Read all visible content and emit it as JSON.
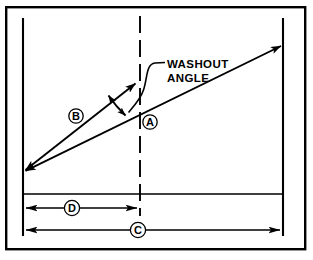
{
  "figure": {
    "kind": "technical-line-diagram",
    "background_color": "#ffffff",
    "ink_color": "#000000",
    "frame": {
      "label": "outer-border",
      "x": 5,
      "y": 6,
      "width": 301,
      "height": 244,
      "stroke_width": 2.4
    }
  },
  "annotations": {
    "callout": {
      "line1": "WASHOUT",
      "line2": "ANGLE",
      "x": 167,
      "y1": 64,
      "y2": 78
    },
    "bubbles": [
      {
        "id": "bubble-a",
        "label": "A",
        "cx": 150,
        "cy": 122,
        "r": 7.2
      },
      {
        "id": "bubble-b",
        "label": "B",
        "cx": 76,
        "cy": 116,
        "r": 7.2
      },
      {
        "id": "bubble-c",
        "label": "C",
        "cx": 138,
        "cy": 230,
        "r": 7.2
      },
      {
        "id": "bubble-d",
        "label": "D",
        "cx": 72,
        "cy": 208,
        "r": 7.2
      }
    ]
  },
  "geometry": {
    "reference_lines": [
      {
        "id": "left-vertical",
        "x1": 23,
        "y1": 18,
        "x2": 23,
        "y2": 236
      },
      {
        "id": "right-vertical",
        "x1": 283,
        "y1": 18,
        "x2": 283,
        "y2": 236
      },
      {
        "id": "center-dashed",
        "x1": 140,
        "y1": 16,
        "x2": 140,
        "y2": 216,
        "dashed": true
      },
      {
        "id": "baseline-horizontal",
        "x1": 23,
        "y1": 194,
        "x2": 283,
        "y2": 194
      }
    ],
    "vectors": [
      {
        "id": "line-a-chord",
        "from_x": 23,
        "from_y": 172,
        "to_x": 283,
        "to_y": 45,
        "double_headed": true,
        "description": "long shallow reference chord"
      },
      {
        "id": "line-b-chord",
        "from_x": 23,
        "from_y": 172,
        "to_x": 137,
        "to_y": 82,
        "double_headed": true,
        "description": "steeper washed-out chord"
      }
    ],
    "angle_arc": {
      "id": "washout-angle-arc",
      "vertex_x": 23,
      "vertex_y": 172,
      "radius": 123,
      "double_headed": true
    },
    "dimensions": [
      {
        "id": "dim-d",
        "x1": 24,
        "x2": 139,
        "y": 208,
        "label": "D"
      },
      {
        "id": "dim-c",
        "x1": 24,
        "x2": 282,
        "y": 230,
        "label": "C"
      }
    ]
  }
}
